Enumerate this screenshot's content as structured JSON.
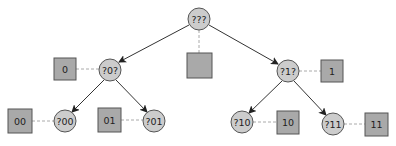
{
  "diagram": {
    "type": "binary-tree",
    "colors": {
      "circle_fill": "#cccccc",
      "square_fill": "#a9a9a9",
      "stroke": "#555555",
      "edge": "#333333",
      "dashed_link": "#aaaaaa"
    },
    "nodes": {
      "root": {
        "label": "???",
        "leaf_label": ""
      },
      "n0": {
        "label": "?0?",
        "leaf_label": "0"
      },
      "n1": {
        "label": "?1?",
        "leaf_label": "1"
      },
      "n00": {
        "label": "?00",
        "leaf_label": "00"
      },
      "n01": {
        "label": "?01",
        "leaf_label": "01"
      },
      "n10": {
        "label": "?10",
        "leaf_label": "10"
      },
      "n11": {
        "label": "?11",
        "leaf_label": "11"
      }
    },
    "edges": [
      {
        "from": "???",
        "to": "?0?"
      },
      {
        "from": "???",
        "to": "?1?"
      },
      {
        "from": "?0?",
        "to": "?00"
      },
      {
        "from": "?0?",
        "to": "?01"
      },
      {
        "from": "?1?",
        "to": "?10"
      },
      {
        "from": "?1?",
        "to": "?11"
      }
    ]
  }
}
